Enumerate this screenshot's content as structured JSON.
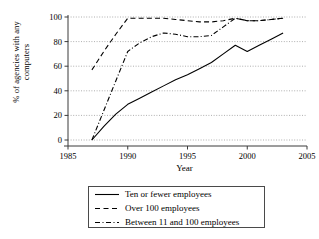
{
  "chart_data": {
    "type": "line",
    "title": "",
    "xlabel": "Year",
    "ylabel_line1": "% of agencies with any",
    "ylabel_line2": "computers",
    "ylabel": "% of agencies with any computers",
    "xlim": [
      1985,
      2005
    ],
    "ylim": [
      0,
      100
    ],
    "xticks": [
      1985,
      1990,
      1995,
      2000,
      2005
    ],
    "yticks": [
      0,
      20,
      40,
      60,
      80,
      100
    ],
    "grid": "horizontal-dotted",
    "legend_position": "below-axes",
    "series": [
      {
        "name": "Ten or fewer employees",
        "style": "solid",
        "x": [
          1987,
          1988,
          1989,
          1990,
          1991,
          1992,
          1993,
          1994,
          1995,
          1996,
          1997,
          1998,
          1999,
          2000,
          2001,
          2002,
          2003
        ],
        "values": [
          0,
          11,
          21,
          29,
          34,
          39,
          44,
          49,
          53,
          58,
          63,
          70,
          77,
          72,
          77,
          82,
          87
        ]
      },
      {
        "name": "Over 100 employees",
        "style": "dashed",
        "x": [
          1987,
          1988,
          1989,
          1990,
          1991,
          1992,
          1993,
          1994,
          1995,
          1996,
          1997,
          1998,
          1999,
          2000,
          2001,
          2002,
          2003
        ],
        "values": [
          57,
          72,
          86,
          99,
          99,
          99,
          99,
          98,
          97,
          96,
          96,
          97,
          99,
          97,
          97,
          98,
          99
        ]
      },
      {
        "name": "Between 11 and 100 employees",
        "style": "dash-dot",
        "x": [
          1987,
          1988,
          1989,
          1990,
          1991,
          1992,
          1993,
          1994,
          1995,
          1996,
          1997,
          1998,
          1999,
          2000,
          2001,
          2002,
          2003
        ],
        "values": [
          0,
          24,
          48,
          72,
          79,
          84,
          87,
          86,
          84,
          84,
          85,
          92,
          99,
          97,
          97,
          98,
          99
        ]
      }
    ],
    "legend_entries": [
      {
        "label": "Ten or fewer employees",
        "style": "solid"
      },
      {
        "label": "Over 100 employees",
        "style": "dashed"
      },
      {
        "label": "Between 11 and 100 employees",
        "style": "dash-dot"
      }
    ],
    "colors": {
      "line": "#000000",
      "grid": "#9a9a9a",
      "axis": "#3a3a3a",
      "background": "#ffffff",
      "legend_border": "#4a4a4a"
    }
  }
}
